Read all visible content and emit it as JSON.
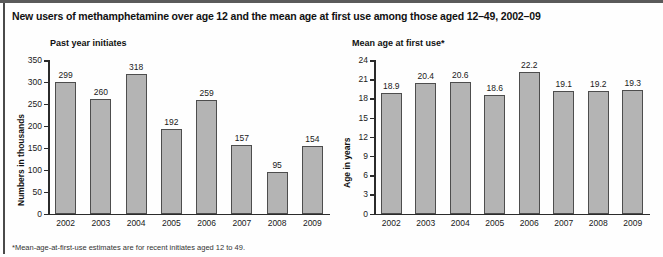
{
  "figure": {
    "title": "New users of methamphetamine over age 12 and the mean age at first use among those aged 12–49, 2002–09",
    "footnote": "*Mean-age-at-first-use estimates are for recent initiates aged 12 to 49."
  },
  "style": {
    "bar_fill": "#b4b4b4",
    "bar_stroke": "#4d4d4d",
    "axis_color": "#2b2b2b",
    "rule_color": "#5a5a5a",
    "background": "#fefefe"
  },
  "chart_data": [
    {
      "type": "bar",
      "title": "Past year initiates",
      "xlabel": "",
      "ylabel": "Numbers in thousands",
      "categories": [
        "2002",
        "2003",
        "2004",
        "2005",
        "2006",
        "2007",
        "2008",
        "2009"
      ],
      "values": [
        299,
        260,
        318,
        192,
        259,
        157,
        95,
        154
      ],
      "value_labels": [
        "299",
        "260",
        "318",
        "192",
        "259",
        "157",
        "95",
        "154"
      ],
      "ylim": [
        0,
        350
      ],
      "yticks": [
        0,
        50,
        100,
        150,
        200,
        250,
        300,
        350
      ],
      "ytick_labels": [
        "0",
        "50",
        "100",
        "150",
        "200",
        "250",
        "300",
        "350"
      ],
      "grid": false,
      "legend": "none"
    },
    {
      "type": "bar",
      "title": "Mean age at first use*",
      "xlabel": "",
      "ylabel": "Age in years",
      "categories": [
        "2002",
        "2003",
        "2004",
        "2005",
        "2006",
        "2007",
        "2008",
        "2009"
      ],
      "values": [
        18.9,
        20.4,
        20.6,
        18.6,
        22.2,
        19.1,
        19.2,
        19.3
      ],
      "value_labels": [
        "18.9",
        "20.4",
        "20.6",
        "18.6",
        "22.2",
        "19.1",
        "19.2",
        "19.3"
      ],
      "ylim": [
        0,
        24
      ],
      "yticks": [
        0,
        3,
        6,
        9,
        12,
        15,
        18,
        21,
        24
      ],
      "ytick_labels": [
        "0",
        "3",
        "6",
        "9",
        "12",
        "15",
        "18",
        "21",
        "24"
      ],
      "grid": false,
      "legend": "none"
    }
  ]
}
